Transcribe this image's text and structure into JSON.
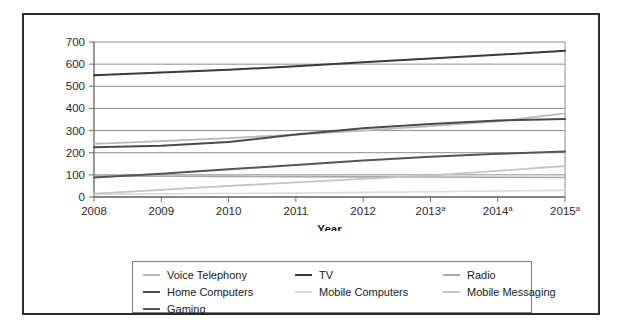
{
  "chart_data": {
    "type": "line",
    "title": "",
    "xlabel": "Year",
    "ylabel": "",
    "ylim": [
      0,
      700
    ],
    "yticks": [
      0,
      100,
      200,
      300,
      400,
      500,
      600,
      700
    ],
    "ytick_labels": [
      "0",
      "100",
      "200",
      "300",
      "400",
      "500",
      "600",
      "700"
    ],
    "grid": true,
    "legend_position": "bottom",
    "x": [
      2008,
      2009,
      2010,
      2011,
      2012,
      2013,
      2014,
      2015
    ],
    "categories": [
      "2008",
      "2009",
      "2010",
      "2011",
      "2012",
      "2013",
      "2014",
      "2015"
    ],
    "xtick_labels": [
      {
        "text": "2008",
        "sup": ""
      },
      {
        "text": "2009",
        "sup": ""
      },
      {
        "text": "2010",
        "sup": ""
      },
      {
        "text": "2011",
        "sup": ""
      },
      {
        "text": "2012",
        "sup": ""
      },
      {
        "text": "2013",
        "sup": "a"
      },
      {
        "text": "2014",
        "sup": "a"
      },
      {
        "text": "2015",
        "sup": "a"
      }
    ],
    "series": [
      {
        "name": "Voice Telephony",
        "color": "#b9b9b9",
        "width": 1.8,
        "values": [
          240,
          252,
          266,
          282,
          300,
          320,
          342,
          378
        ]
      },
      {
        "name": "TV",
        "color": "#3a3a3a",
        "width": 2.0,
        "values": [
          550,
          562,
          575,
          590,
          608,
          625,
          642,
          660
        ]
      },
      {
        "name": "Radio",
        "color": "#a8a8a8",
        "width": 1.6,
        "values": [
          95,
          94,
          93,
          92,
          91,
          90,
          89,
          88
        ]
      },
      {
        "name": "Home Computers",
        "color": "#4a4a4a",
        "width": 2.0,
        "values": [
          225,
          232,
          248,
          282,
          310,
          330,
          345,
          352
        ]
      },
      {
        "name": "Mobile Computers",
        "color": "#dcdcdc",
        "width": 1.6,
        "values": [
          12,
          14,
          16,
          18,
          21,
          24,
          27,
          30
        ]
      },
      {
        "name": "Mobile Messaging",
        "color": "#c4c4c4",
        "width": 1.8,
        "values": [
          15,
          32,
          50,
          66,
          82,
          98,
          118,
          140
        ]
      },
      {
        "name": "Gaming",
        "color": "#555555",
        "width": 2.0,
        "values": [
          88,
          105,
          125,
          145,
          165,
          182,
          195,
          205
        ]
      }
    ]
  },
  "legend": {
    "entries": [
      {
        "label": "Voice Telephony",
        "color": "#b9b9b9"
      },
      {
        "label": "TV",
        "color": "#3a3a3a"
      },
      {
        "label": "Radio",
        "color": "#a8a8a8"
      },
      {
        "label": "Home Computers",
        "color": "#4a4a4a"
      },
      {
        "label": "Mobile Computers",
        "color": "#dcdcdc"
      },
      {
        "label": "Mobile Messaging",
        "color": "#c4c4c4"
      },
      {
        "label": "Gaming",
        "color": "#555555"
      }
    ],
    "order": [
      0,
      1,
      2,
      3,
      4,
      5,
      6
    ]
  },
  "colors": {
    "frame": "#2b2b2b",
    "grid": "#8d8d8d",
    "axis": "#6f6f6f",
    "text": "#1a1a1a",
    "background": "#ffffff"
  }
}
